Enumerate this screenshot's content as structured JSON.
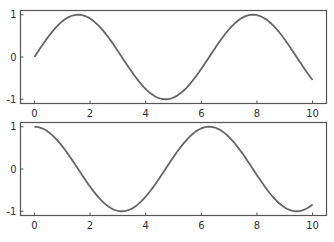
{
  "chart_data": [
    {
      "type": "line",
      "title": "",
      "xlabel": "",
      "ylabel": "",
      "xlim": [
        -0.5,
        10.5
      ],
      "ylim": [
        -1.1,
        1.1
      ],
      "xticks": [
        0,
        2,
        4,
        6,
        8,
        10
      ],
      "xtick_labels": [
        "0",
        "2",
        "4",
        "6",
        "8",
        "10"
      ],
      "yticks": [
        -1,
        0,
        1
      ],
      "ytick_labels": [
        "-1",
        "0",
        "1"
      ],
      "grid": false,
      "legend": null,
      "series": [
        {
          "name": "sin(x)",
          "function": "sin",
          "x_range": [
            0,
            10
          ],
          "x": [
            0,
            1,
            1.57,
            2,
            3,
            4,
            4.71,
            5,
            6,
            7,
            7.85,
            8,
            9,
            10
          ],
          "y": [
            0,
            0.84,
            1.0,
            0.91,
            0.14,
            -0.76,
            -1.0,
            -0.96,
            -0.28,
            0.66,
            1.0,
            0.99,
            0.41,
            -0.54
          ],
          "color": "#666666"
        }
      ]
    },
    {
      "type": "line",
      "title": "",
      "xlabel": "",
      "ylabel": "",
      "xlim": [
        -0.5,
        10.5
      ],
      "ylim": [
        -1.1,
        1.1
      ],
      "xticks": [
        0,
        2,
        4,
        6,
        8,
        10
      ],
      "xtick_labels": [
        "0",
        "2",
        "4",
        "6",
        "8",
        "10"
      ],
      "yticks": [
        -1,
        0,
        1
      ],
      "ytick_labels": [
        "-1",
        "0",
        "1"
      ],
      "grid": false,
      "legend": null,
      "series": [
        {
          "name": "cos(x)",
          "function": "cos",
          "x_range": [
            0,
            10
          ],
          "x": [
            0,
            1,
            2,
            3,
            3.14,
            4,
            5,
            6,
            6.28,
            7,
            8,
            9,
            9.42,
            10
          ],
          "y": [
            1.0,
            0.54,
            -0.42,
            -0.99,
            -1.0,
            -0.65,
            0.28,
            0.96,
            1.0,
            0.75,
            -0.15,
            -0.91,
            -1.0,
            -0.84
          ],
          "color": "#666666"
        }
      ]
    }
  ],
  "panels": [
    {
      "name": "top",
      "x_labels": [
        "0",
        "2",
        "4",
        "6",
        "8",
        "10"
      ],
      "y_labels": [
        "1",
        "0",
        "-1"
      ]
    },
    {
      "name": "bottom",
      "x_labels": [
        "0",
        "2",
        "4",
        "6",
        "8",
        "10"
      ],
      "y_labels": [
        "1",
        "0",
        "-1"
      ]
    }
  ],
  "colors": {
    "line": "#666666",
    "frame": "#555555",
    "text": "#333333"
  }
}
